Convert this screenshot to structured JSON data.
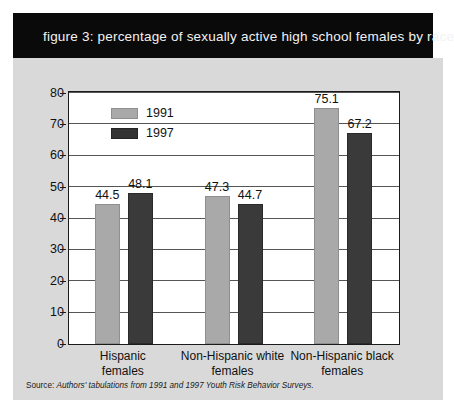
{
  "figure": {
    "title": "figure 3: percentage of sexually active high school females by race",
    "source_prefix": "Source:",
    "source_body": "Authors' tabulations from 1991 and 1997 Youth Risk Behavior Surveys."
  },
  "colors": {
    "banner_background": "#0a0a0a",
    "banner_text": "#f2f2f2",
    "panel_background": "#d9d9d9",
    "plot_background": "#ffffff",
    "axis": "#1b1b1b",
    "gridline": "#555555",
    "series_1991": "#a9a9a9",
    "series_1997": "#3a3a3a"
  },
  "chart_data": {
    "type": "bar",
    "title": "figure 3: percentage of sexually active high school females by race",
    "xlabel": "",
    "ylabel": "",
    "ylim": [
      0,
      80
    ],
    "yticks": [
      0,
      10,
      20,
      30,
      40,
      50,
      60,
      70,
      80
    ],
    "ytick_labels": [
      "0",
      "10",
      "20",
      "30",
      "40",
      "50",
      "60",
      "70",
      "80"
    ],
    "grid": true,
    "legend_position": "upper-left-inside",
    "categories": [
      "Hispanic females",
      "Non-Hispanic white females",
      "Non-Hispanic black females"
    ],
    "category_lines": [
      [
        "Hispanic",
        "females"
      ],
      [
        "Non-Hispanic white",
        "females"
      ],
      [
        "Non-Hispanic black",
        "females"
      ]
    ],
    "series": [
      {
        "name": "1991",
        "color": "#a9a9a9",
        "values": [
          44.5,
          47.3,
          75.1
        ],
        "value_labels": [
          "44.5",
          "47.3",
          "75.1"
        ]
      },
      {
        "name": "1997",
        "color": "#3a3a3a",
        "values": [
          48.1,
          44.7,
          67.2
        ],
        "value_labels": [
          "48.1",
          "44.7",
          "67.2"
        ]
      }
    ]
  }
}
